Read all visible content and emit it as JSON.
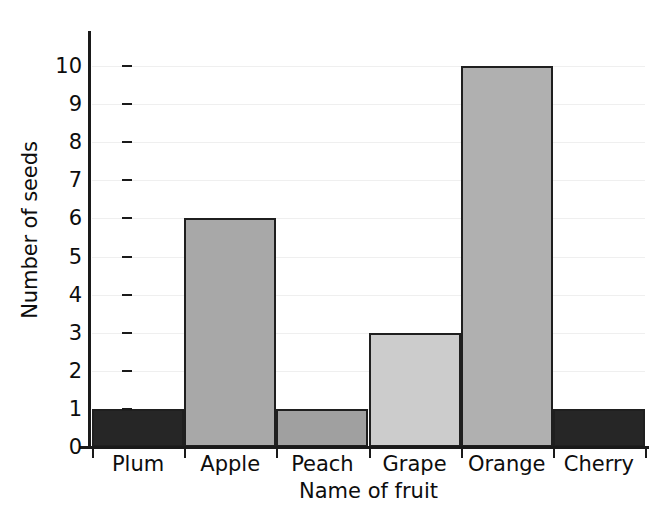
{
  "chart_data": {
    "type": "bar",
    "title": "",
    "xlabel": "Name of fruit",
    "ylabel": "Number of seeds",
    "categories": [
      "Plum",
      "Apple",
      "Peach",
      "Grape",
      "Orange",
      "Cherry"
    ],
    "values": [
      1,
      6,
      1,
      3,
      10,
      1
    ],
    "ylim": [
      0,
      10
    ],
    "ytick_labels": [
      "0",
      "1",
      "2",
      "3",
      "4",
      "5",
      "6",
      "7",
      "8",
      "9",
      "10"
    ],
    "ytick_values": [
      0,
      1,
      2,
      3,
      4,
      5,
      6,
      7,
      8,
      9,
      10
    ],
    "grid": true,
    "grid_axis": "y",
    "legend": false,
    "bar_gap": 0,
    "bar_colors": [
      "#262626",
      "#a8a8a8",
      "#a0a0a0",
      "#cccccc",
      "#b0b0b0",
      "#262626"
    ],
    "bar_edge_color": "#1f1f1f",
    "grid_color": "#efefef",
    "axis_color": "#1a1a1a",
    "background": "#ffffff",
    "text_color": "#0d0d0d"
  }
}
